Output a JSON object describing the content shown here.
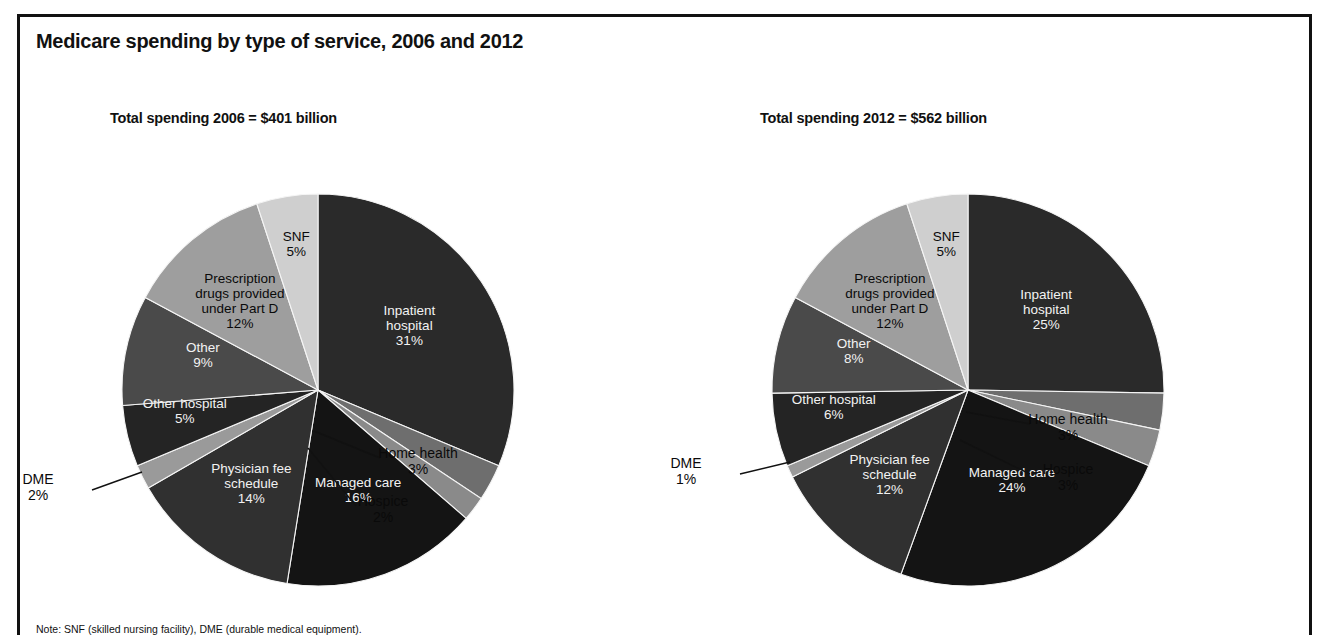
{
  "figure": {
    "title": "Medicare spending by type of service, 2006 and 2012",
    "footnote": "Note: SNF (skilled nursing facility), DME (durable medical equipment).",
    "border_color": "#111111",
    "background_color": "#ffffff"
  },
  "chart_data": [
    {
      "type": "pie",
      "title": "Total spending 2006 = $401 billion",
      "total_label": "$401 billion",
      "year": "2006",
      "start_angle_deg": 0,
      "direction": "clockwise",
      "categories": [
        "Inpatient hospital",
        "Home health",
        "Hospice",
        "Managed care",
        "Physician fee schedule",
        "DME",
        "Other hospital",
        "Other",
        "Prescription drugs provided under Part D",
        "SNF"
      ],
      "values": [
        31,
        3,
        2,
        16,
        14,
        2,
        5,
        9,
        12,
        5
      ],
      "slices": [
        {
          "label": "Inpatient hospital",
          "value": 31,
          "value_text": "31%",
          "label_text": "Inpatient\nhospital\n31%",
          "color": "#2a2a2a",
          "label_placement": "inside",
          "label_color": "light"
        },
        {
          "label": "Home health",
          "value": 3,
          "value_text": "3%",
          "label_text": "Home health\n3%",
          "color": "#6e6e6e",
          "label_placement": "outside",
          "label_color": "dark"
        },
        {
          "label": "Hospice",
          "value": 2,
          "value_text": "2%",
          "label_text": "Hospice\n2%",
          "color": "#8a8a8a",
          "label_placement": "outside",
          "label_color": "dark"
        },
        {
          "label": "Managed care",
          "value": 16,
          "value_text": "16%",
          "label_text": "Managed care\n16%",
          "color": "#141414",
          "label_placement": "inside",
          "label_color": "light"
        },
        {
          "label": "Physician fee schedule",
          "value": 14,
          "value_text": "14%",
          "label_text": "Physician fee\nschedule\n14%",
          "color": "#303030",
          "label_placement": "inside",
          "label_color": "light"
        },
        {
          "label": "DME",
          "value": 2,
          "value_text": "2%",
          "label_text": "DME\n2%",
          "color": "#9a9a9a",
          "label_placement": "outside",
          "label_color": "dark"
        },
        {
          "label": "Other hospital",
          "value": 5,
          "value_text": "5%",
          "label_text": "Other hospital\n5%",
          "color": "#242424",
          "label_placement": "inside",
          "label_color": "light"
        },
        {
          "label": "Other",
          "value": 9,
          "value_text": "9%",
          "label_text": "Other\n9%",
          "color": "#4a4a4a",
          "label_placement": "inside",
          "label_color": "light"
        },
        {
          "label": "Prescription drugs provided under Part D",
          "value": 12,
          "value_text": "12%",
          "label_text": "Prescription\ndrugs provided\nunder Part D\n12%",
          "color": "#9e9e9e",
          "label_placement": "inside",
          "label_color": "dark"
        },
        {
          "label": "SNF",
          "value": 5,
          "value_text": "5%",
          "label_text": "SNF\n5%",
          "color": "#cfcfcf",
          "label_placement": "inside",
          "label_color": "dark"
        }
      ]
    },
    {
      "type": "pie",
      "title": "Total spending 2012 = $562 billion",
      "total_label": "$562 billion",
      "year": "2012",
      "start_angle_deg": 0,
      "direction": "clockwise",
      "categories": [
        "Inpatient hospital",
        "Home health",
        "Hospice",
        "Managed care",
        "Physician fee schedule",
        "DME",
        "Other hospital",
        "Other",
        "Prescription drugs provided under Part D",
        "SNF"
      ],
      "values": [
        25,
        3,
        3,
        24,
        12,
        1,
        6,
        8,
        12,
        5
      ],
      "slices": [
        {
          "label": "Inpatient hospital",
          "value": 25,
          "value_text": "25%",
          "label_text": "Inpatient\nhospital\n25%",
          "color": "#2a2a2a",
          "label_placement": "inside",
          "label_color": "light"
        },
        {
          "label": "Home health",
          "value": 3,
          "value_text": "3%",
          "label_text": "Home health\n3%",
          "color": "#6e6e6e",
          "label_placement": "outside",
          "label_color": "dark"
        },
        {
          "label": "Hospice",
          "value": 3,
          "value_text": "3%",
          "label_text": "Hospice\n3%",
          "color": "#8a8a8a",
          "label_placement": "outside",
          "label_color": "dark"
        },
        {
          "label": "Managed care",
          "value": 24,
          "value_text": "24%",
          "label_text": "Managed care\n24%",
          "color": "#141414",
          "label_placement": "inside",
          "label_color": "light"
        },
        {
          "label": "Physician fee schedule",
          "value": 12,
          "value_text": "12%",
          "label_text": "Physician fee\nschedule\n12%",
          "color": "#303030",
          "label_placement": "inside",
          "label_color": "light"
        },
        {
          "label": "DME",
          "value": 1,
          "value_text": "1%",
          "label_text": "DME\n1%",
          "color": "#9a9a9a",
          "label_placement": "outside",
          "label_color": "dark"
        },
        {
          "label": "Other hospital",
          "value": 6,
          "value_text": "6%",
          "label_text": "Other hospital\n6%",
          "color": "#242424",
          "label_placement": "inside",
          "label_color": "light"
        },
        {
          "label": "Other",
          "value": 8,
          "value_text": "8%",
          "label_text": "Other\n8%",
          "color": "#4a4a4a",
          "label_placement": "inside",
          "label_color": "light"
        },
        {
          "label": "Prescription drugs provided under Part D",
          "value": 12,
          "value_text": "12%",
          "label_text": "Prescription\ndrugs provided\nunder Part D\n12%",
          "color": "#9e9e9e",
          "label_placement": "inside",
          "label_color": "dark"
        },
        {
          "label": "SNF",
          "value": 5,
          "value_text": "5%",
          "label_text": "SNF\n5%",
          "color": "#cfcfcf",
          "label_placement": "inside",
          "label_color": "dark"
        }
      ]
    }
  ],
  "external_labels": [
    {
      "chart": 0,
      "label": "Home health",
      "text": "Home health\n3%",
      "x": 300,
      "y": 272,
      "anchor_x": 196,
      "anchor_y": 241,
      "tip_x": 262,
      "tip_y": 268
    },
    {
      "chart": 0,
      "label": "Hospice",
      "text": "Hospice\n2%",
      "x": 265,
      "y": 320,
      "anchor_x": 190,
      "anchor_y": 258,
      "tip_x": 238,
      "tip_y": 316
    },
    {
      "chart": 0,
      "label": "DME",
      "text": "DME\n2%",
      "x": -80,
      "y": 298,
      "anchor_x": 24,
      "anchor_y": 282,
      "tip_x": -26,
      "tip_y": 300
    },
    {
      "chart": 1,
      "label": "Home health",
      "text": "Home health\n3%",
      "x": 300,
      "y": 238,
      "anchor_x": 198,
      "anchor_y": 222,
      "tip_x": 262,
      "tip_y": 234
    },
    {
      "chart": 1,
      "label": "Hospice",
      "text": "Hospice\n3%",
      "x": 300,
      "y": 288,
      "anchor_x": 192,
      "anchor_y": 250,
      "tip_x": 262,
      "tip_y": 284
    },
    {
      "chart": 1,
      "label": "DME",
      "text": "DME\n1%",
      "x": -82,
      "y": 282,
      "anchor_x": 22,
      "anchor_y": 272,
      "tip_x": -28,
      "tip_y": 284
    }
  ]
}
